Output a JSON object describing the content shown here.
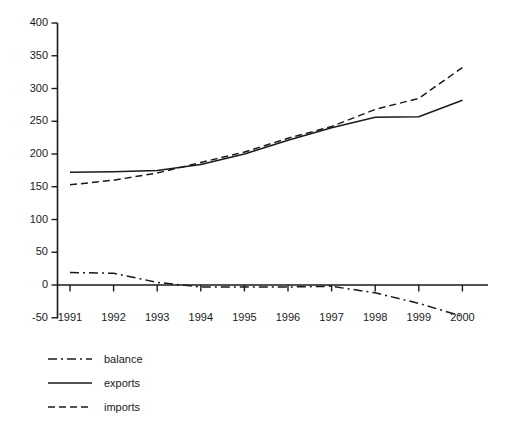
{
  "chart_data": {
    "type": "line",
    "title": "",
    "subtitle": "",
    "xlabel": "",
    "ylabel": "",
    "categories": [
      "1991",
      "1992",
      "1993",
      "1994",
      "1995",
      "1996",
      "1997",
      "1998",
      "1999",
      "2000"
    ],
    "x": [
      1991,
      1992,
      1993,
      1994,
      1995,
      1996,
      1997,
      1998,
      1999,
      2000
    ],
    "series": [
      {
        "name": "balance",
        "style": "dash-dot",
        "color": "#1a1a1a",
        "values": [
          19,
          18,
          4,
          -3,
          -3,
          -3,
          -2,
          -12,
          -28,
          -48
        ]
      },
      {
        "name": "exports",
        "style": "solid",
        "color": "#1a1a1a",
        "values": [
          172,
          173,
          175,
          184,
          200,
          221,
          240,
          256,
          257,
          282
        ]
      },
      {
        "name": "imports",
        "style": "dashed",
        "color": "#1a1a1a",
        "values": [
          153,
          160,
          171,
          187,
          203,
          224,
          242,
          268,
          285,
          332
        ]
      }
    ],
    "ylim": [
      -50,
      400
    ],
    "ytick_step": 50,
    "yticks": [
      -50,
      0,
      50,
      100,
      150,
      200,
      250,
      300,
      350,
      400
    ],
    "ytick_labels": [
      "-50",
      "0",
      "50",
      "100",
      "150",
      "200",
      "250",
      "300",
      "350",
      "400"
    ],
    "xticks": [
      "1991",
      "1992",
      "1993",
      "1994",
      "1995",
      "1996",
      "1997",
      "1998",
      "1999",
      "2000"
    ],
    "grid": false,
    "legend_position": "below-left",
    "legend_entries": [
      {
        "label": "balance",
        "style": "dash-dot"
      },
      {
        "label": "exports",
        "style": "solid"
      },
      {
        "label": "imports",
        "style": "dashed"
      }
    ],
    "axis_color": "#1a1a1a",
    "background": "#ffffff"
  }
}
